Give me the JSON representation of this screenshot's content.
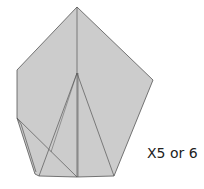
{
  "diagram": {
    "fill_color": "#cccccc",
    "stroke_color": "#444444",
    "background": "#ffffff"
  },
  "annotation": {
    "repeat_label": "X5 or 6"
  }
}
